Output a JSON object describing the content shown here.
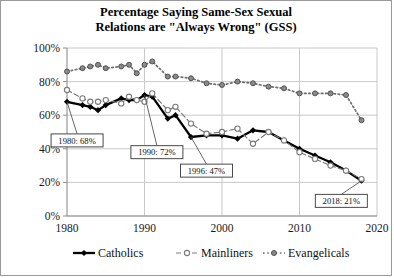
{
  "chart_data": {
    "type": "line",
    "title": "Percentage Saying Same-Sex Sexual Relations are \"Always Wrong\" (GSS)",
    "title_line1": "Percentage Saying Same-Sex Sexual",
    "title_line2": "Relations are \"Always Wrong\" (GSS)",
    "xlabel": "",
    "ylabel": "",
    "xlim": [
      1980,
      2020
    ],
    "ylim": [
      0,
      100
    ],
    "grid": true,
    "legend_position": "bottom",
    "xticks": [
      1980,
      1990,
      2000,
      2010,
      2020
    ],
    "xticklabels": [
      "1980",
      "1990",
      "2000",
      "2010",
      "2020"
    ],
    "yticks": [
      0,
      20,
      40,
      60,
      80,
      100
    ],
    "yticklabels": [
      "0%",
      "20%",
      "40%",
      "60%",
      "80%",
      "100%"
    ],
    "series": [
      {
        "name": "Catholics",
        "color": "#000000",
        "style": "solid",
        "marker": "filled-diamond",
        "x": [
          1980,
          1982,
          1983,
          1984,
          1985,
          1987,
          1988,
          1989,
          1990,
          1991,
          1993,
          1994,
          1996,
          1998,
          2000,
          2002,
          2004,
          2006,
          2008,
          2010,
          2012,
          2014,
          2016,
          2018
        ],
        "values": [
          68,
          66,
          65,
          63,
          66,
          70,
          69,
          69,
          72,
          71,
          58,
          60,
          47,
          48,
          48,
          46,
          51,
          50,
          45,
          40,
          36,
          32,
          27,
          21
        ]
      },
      {
        "name": "Mainliners",
        "color": "#7a7a7a",
        "style": "dashed",
        "marker": "open-circle",
        "x": [
          1980,
          1982,
          1983,
          1984,
          1985,
          1987,
          1988,
          1989,
          1990,
          1991,
          1993,
          1994,
          1996,
          1998,
          2000,
          2002,
          2004,
          2006,
          2008,
          2010,
          2012,
          2014,
          2016,
          2018
        ],
        "values": [
          75,
          70,
          68,
          68,
          69,
          67,
          71,
          69,
          68,
          73,
          63,
          65,
          55,
          49,
          50,
          52,
          43,
          50,
          45,
          38,
          34,
          30,
          27,
          22
        ]
      },
      {
        "name": "Evangelicals",
        "color": "#6e6e6e",
        "style": "dotted",
        "marker": "small-filled-circle",
        "x": [
          1980,
          1982,
          1983,
          1984,
          1985,
          1987,
          1988,
          1989,
          1990,
          1991,
          1993,
          1994,
          1996,
          1998,
          2000,
          2002,
          2004,
          2006,
          2008,
          2010,
          2012,
          2014,
          2016,
          2018
        ],
        "values": [
          86,
          88,
          89,
          90,
          88,
          89,
          90,
          85,
          90,
          92,
          83,
          83,
          82,
          79,
          78,
          80,
          79,
          77,
          76,
          73,
          73,
          73,
          72,
          57
        ]
      }
    ],
    "annotations": [
      {
        "id": "a1980",
        "label": "1980: 68%",
        "x": 1980,
        "y": 68,
        "box_x": 1981.3,
        "box_y": 45
      },
      {
        "id": "a1990",
        "label": "1990: 72%",
        "x": 1990,
        "y": 72,
        "box_x": 1991.6,
        "box_y": 38
      },
      {
        "id": "a1996",
        "label": "1996: 47%",
        "x": 1996,
        "y": 47,
        "box_x": 1998.0,
        "box_y": 27
      },
      {
        "id": "a2018",
        "label": "2018: 21%",
        "x": 2018,
        "y": 21,
        "box_x": 2015.4,
        "box_y": 9
      }
    ],
    "legend": [
      {
        "label": "Catholics",
        "marker": "filled-diamond",
        "style": "solid"
      },
      {
        "label": "Mainliners",
        "marker": "open-circle",
        "style": "dashed"
      },
      {
        "label": "Evangelicals",
        "marker": "small-filled-circle",
        "style": "dotted"
      }
    ]
  }
}
